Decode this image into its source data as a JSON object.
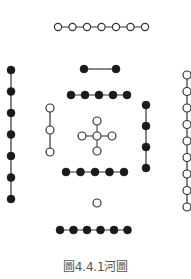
{
  "title": "河圖",
  "caption": "圖4.4.1河圖",
  "colors": {
    "black_dot": "#1a1a1a",
    "white_dot_fill": "#ffffff",
    "white_dot_stroke": "#333333",
    "line": "#333333",
    "caption_text": "#555555"
  },
  "groups": [
    {
      "id": "top-outer",
      "count": 7,
      "color": "white",
      "orientation": "horizontal",
      "x0": 58,
      "y0": 27,
      "step": 14.5,
      "r": 3.6
    },
    {
      "id": "top-inner-2",
      "count": 2,
      "color": "black",
      "orientation": "horizontal",
      "x0": 84,
      "y0": 69,
      "step": 32,
      "r": 4
    },
    {
      "id": "top-inner-5",
      "count": 5,
      "color": "black",
      "orientation": "horizontal",
      "x0": 71,
      "y0": 95,
      "step": 14,
      "r": 4
    },
    {
      "id": "left-outer",
      "count": 7,
      "color": "black",
      "orientation": "vertical",
      "x0": 11,
      "y0": 70,
      "step": 21.5,
      "r": 4
    },
    {
      "id": "left-inner",
      "count": 3,
      "color": "white",
      "orientation": "vertical",
      "x0": 50,
      "y0": 108,
      "step": 22,
      "r": 4
    },
    {
      "id": "center",
      "count": 5,
      "color": "white",
      "orientation": "cross",
      "x0": 97,
      "y0": 136,
      "step": 15,
      "r": 4
    },
    {
      "id": "right-inner",
      "count": 4,
      "color": "black",
      "orientation": "vertical",
      "x0": 146,
      "y0": 105,
      "step": 21,
      "r": 4
    },
    {
      "id": "right-outer",
      "count": 9,
      "color": "white",
      "orientation": "vertical",
      "x0": 187,
      "y0": 75,
      "step": 16.5,
      "r": 4
    },
    {
      "id": "bottom-inner-5",
      "count": 5,
      "color": "black",
      "orientation": "horizontal",
      "x0": 66,
      "y0": 172,
      "step": 14.5,
      "r": 4
    },
    {
      "id": "bottom-inner-1",
      "count": 1,
      "color": "white",
      "orientation": "single",
      "x0": 97,
      "y0": 203,
      "step": 0,
      "r": 4
    },
    {
      "id": "bottom-outer",
      "count": 6,
      "color": "black",
      "orientation": "horizontal",
      "x0": 60,
      "y0": 230,
      "step": 13.5,
      "r": 4
    }
  ]
}
